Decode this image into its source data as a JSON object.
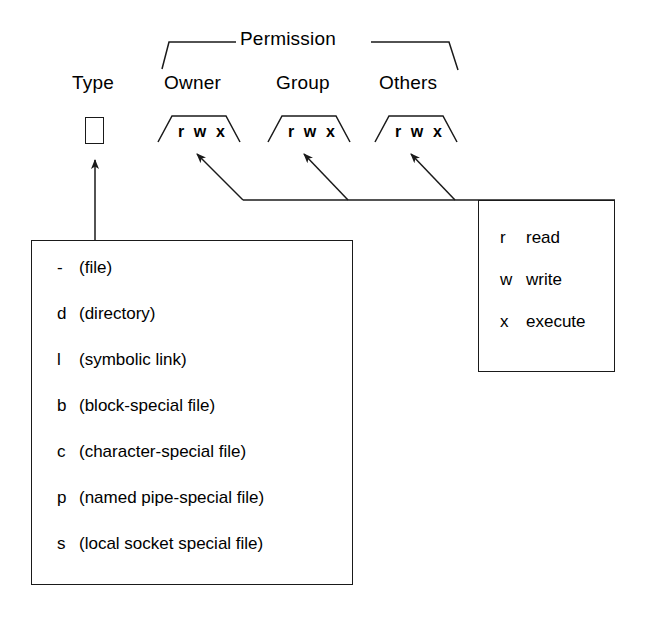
{
  "diagram": {
    "stroke_color": "#1a1a1a",
    "background_color": "#ffffff"
  },
  "headings": {
    "type": "Type",
    "permission": "Permission",
    "owner": "Owner",
    "group": "Group",
    "others": "Others"
  },
  "permission_fields": [
    {
      "name": "owner",
      "bits": "r w x"
    },
    {
      "name": "group",
      "bits": "r w x"
    },
    {
      "name": "others",
      "bits": "r w x"
    }
  ],
  "type_box": {
    "value": ""
  },
  "file_types": [
    {
      "code": "-",
      "desc": "(file)"
    },
    {
      "code": "d",
      "desc": "(directory)"
    },
    {
      "code": "l",
      "desc": "(symbolic link)"
    },
    {
      "code": "b",
      "desc": "(block-special file)"
    },
    {
      "code": "c",
      "desc": "(character-special file)"
    },
    {
      "code": "p",
      "desc": "(named pipe-special file)"
    },
    {
      "code": "s",
      "desc": "(local socket special file)"
    }
  ],
  "permission_legend": [
    {
      "code": "r",
      "desc": "read"
    },
    {
      "code": "w",
      "desc": "write"
    },
    {
      "code": "x",
      "desc": "execute"
    }
  ]
}
